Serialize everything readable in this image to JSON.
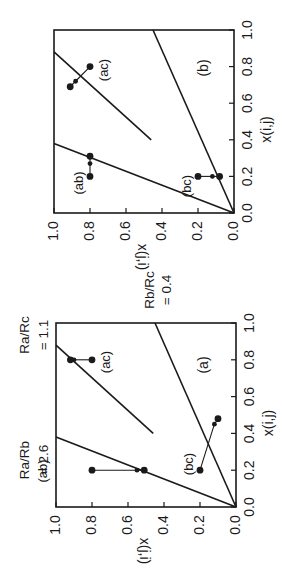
{
  "chart_data": [
    {
      "type": "line",
      "panel": "(a)",
      "xlabel": "x(i,j)",
      "ylabel": "x(j,i)",
      "xlim": [
        0,
        1
      ],
      "ylim": [
        0,
        1
      ],
      "xticks": [
        "0.0",
        "0.2",
        "0.4",
        "0.6",
        "0.8",
        "1.0"
      ],
      "yticks": [
        "0.0",
        "0.2",
        "0.4",
        "0.6",
        "0.8",
        "1.0"
      ],
      "boundary_lines": [
        {
          "label": "Ra/Rb = 2.6",
          "label_line1": "Ra/Rb",
          "label_line2": "= 2.6",
          "x": [
            0.0,
            0.38
          ],
          "y": [
            0.0,
            1.0
          ]
        },
        {
          "label": "Rb/Rc = 0.4",
          "label_line1": "Rb/Rc",
          "label_line2": "= 0.4",
          "x": [
            0.0,
            1.0
          ],
          "y": [
            0.0,
            0.45
          ]
        },
        {
          "label": "Ra/Rc = 1.1",
          "label_line1": "Ra/Rc",
          "label_line2": "= 1.1",
          "x": [
            0.4,
            0.88
          ],
          "y": [
            0.46,
            1.0
          ]
        }
      ],
      "series": [
        {
          "name": "(ab)",
          "x": [
            0.2,
            0.2,
            0.2
          ],
          "y": [
            0.8,
            0.55,
            0.51
          ]
        },
        {
          "name": "(ac)",
          "x": [
            0.8,
            0.8,
            0.8
          ],
          "y": [
            0.8,
            0.9,
            0.92
          ]
        },
        {
          "name": "(bc)",
          "x": [
            0.2,
            0.45,
            0.48
          ],
          "y": [
            0.2,
            0.12,
            0.1
          ]
        }
      ],
      "orientation": "rotated 90 degrees counter-clockwise on page"
    },
    {
      "type": "line",
      "panel": "(b)",
      "xlabel": "x(i,j)",
      "ylabel": "x(j,i)",
      "xlim": [
        0,
        1
      ],
      "ylim": [
        0,
        1
      ],
      "xticks": [
        "0.0",
        "0.2",
        "0.4",
        "0.6",
        "0.8",
        "1.0"
      ],
      "yticks": [
        "0.0",
        "0.2",
        "0.4",
        "0.6",
        "0.8",
        "1.0"
      ],
      "boundary_lines": [
        {
          "x": [
            0.0,
            0.38
          ],
          "y": [
            0.0,
            1.0
          ]
        },
        {
          "x": [
            0.0,
            1.0
          ],
          "y": [
            0.0,
            0.45
          ]
        },
        {
          "x": [
            0.4,
            0.88
          ],
          "y": [
            0.46,
            1.0
          ]
        }
      ],
      "series": [
        {
          "name": "(ab)",
          "x": [
            0.2,
            0.27,
            0.31
          ],
          "y": [
            0.8,
            0.8,
            0.8
          ]
        },
        {
          "name": "(ac)",
          "x": [
            0.8,
            0.72,
            0.69
          ],
          "y": [
            0.8,
            0.88,
            0.91
          ]
        },
        {
          "name": "(bc)",
          "x": [
            0.2,
            0.2,
            0.2
          ],
          "y": [
            0.2,
            0.12,
            0.08
          ]
        }
      ],
      "orientation": "rotated 90 degrees counter-clockwise on page"
    }
  ],
  "panels": {
    "a": {
      "tag": "(a)",
      "xlabel": "x(i,j)",
      "ylabel": "x(j,i)"
    },
    "b": {
      "tag": "(b)",
      "xlabel": "x(i,j)",
      "ylabel": "x(j,i)"
    }
  },
  "ticks": [
    "0.0",
    "0.2",
    "0.4",
    "0.6",
    "0.8",
    "1.0"
  ]
}
